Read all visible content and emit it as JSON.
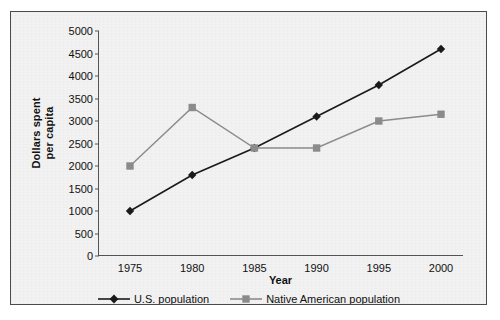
{
  "chart_data": {
    "type": "line",
    "title": "",
    "xlabel": "Year",
    "ylabel": "Dollars spent per capita",
    "ylabel_line1": "Dollars spent",
    "ylabel_line2": "per capita",
    "categories": [
      "1975",
      "1980",
      "1985",
      "1990",
      "1995",
      "2000"
    ],
    "x": [
      1975,
      1980,
      1985,
      1990,
      1995,
      2000
    ],
    "xlim": [
      1973,
      2002
    ],
    "ylim": [
      0,
      5000
    ],
    "ytick_labels": [
      "0",
      "500",
      "1000",
      "1500",
      "2000",
      "2500",
      "3000",
      "3500",
      "4000",
      "4500",
      "5000"
    ],
    "ytick_values": [
      0,
      500,
      1000,
      1500,
      2000,
      2500,
      3000,
      3500,
      4000,
      4500,
      5000
    ],
    "ytick_step": 500,
    "grid": false,
    "legend_position": "bottom",
    "series": [
      {
        "name": "U.S. population",
        "values": [
          1000,
          1800,
          2400,
          3100,
          3800,
          4600
        ],
        "color": "#1a1a1a",
        "marker": "diamond"
      },
      {
        "name": "Native American population",
        "values": [
          2000,
          3300,
          2400,
          2400,
          3000,
          3150
        ],
        "color": "#8c8c8c",
        "marker": "square"
      }
    ]
  },
  "legend": {
    "entries": [
      {
        "label": "U.S. population"
      },
      {
        "label": "Native American population"
      }
    ]
  }
}
